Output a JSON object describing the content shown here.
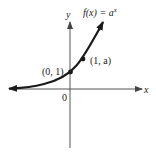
{
  "diagram": {
    "function_label": {
      "prefix": "f(x) = a",
      "superscript": "x"
    },
    "axes": {
      "x_label": "x",
      "y_label": "y",
      "origin_label": "0"
    },
    "points": [
      {
        "label": "(0, 1)"
      },
      {
        "label": "(1, a)"
      }
    ],
    "colors": {
      "curve": "#1a1a1a",
      "axes": "#555555",
      "text": "#222222"
    }
  }
}
